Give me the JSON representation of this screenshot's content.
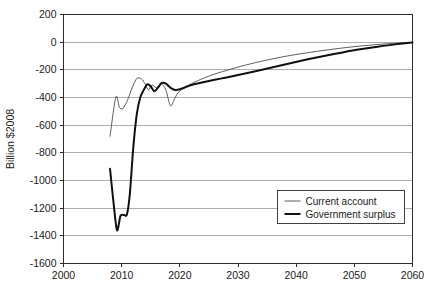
{
  "chart_data": {
    "type": "line",
    "title": "",
    "xlabel": "",
    "ylabel": "Billion $2008",
    "xlim": [
      2000,
      2060
    ],
    "ylim": [
      -1600,
      200
    ],
    "xticks": [
      2000,
      2010,
      2020,
      2030,
      2040,
      2050,
      2060
    ],
    "yticks": [
      200,
      0,
      -200,
      -400,
      -600,
      -800,
      -1000,
      -1200,
      -1400,
      -1600
    ],
    "xtick_labels": [
      "2000",
      "2010",
      "2020",
      "2030",
      "2040",
      "2050",
      "2060"
    ],
    "ytick_labels": [
      "200",
      "0",
      "-200",
      "-400",
      "-600",
      "-800",
      "-1000",
      "-1200",
      "-1400",
      "-1600"
    ],
    "grid": "horizontal",
    "legend_position": "bottom-right",
    "series": [
      {
        "name": "Current account",
        "style": "thin",
        "color": "#4a4a4a",
        "x": [
          2008,
          2009,
          2009.6,
          2010.2,
          2011,
          2011.8,
          2012.6,
          2013.4,
          2014,
          2014.6,
          2015.2,
          2016,
          2016.8,
          2017.6,
          2018.4,
          2019.2,
          2020,
          2022,
          2024,
          2026,
          2028,
          2030,
          2033,
          2036,
          2039,
          2042,
          2045,
          2048,
          2051,
          2054,
          2057,
          2060
        ],
        "y": [
          -680,
          -395,
          -470,
          -480,
          -420,
          -330,
          -262,
          -265,
          -300,
          -345,
          -310,
          -330,
          -300,
          -345,
          -460,
          -400,
          -352,
          -300,
          -262,
          -230,
          -205,
          -180,
          -148,
          -120,
          -96,
          -76,
          -58,
          -42,
          -28,
          -17,
          -8,
          -2
        ]
      },
      {
        "name": "Government surplus",
        "style": "thick",
        "color": "#111111",
        "x": [
          2008,
          2008.6,
          2009.2,
          2009.8,
          2010.4,
          2010.9,
          2011.4,
          2012,
          2012.6,
          2013.2,
          2013.8,
          2014.4,
          2015,
          2015.6,
          2016.2,
          2016.9,
          2017.6,
          2018.4,
          2019.2,
          2020,
          2022,
          2024,
          2026,
          2028,
          2030,
          2033,
          2036,
          2039,
          2042,
          2045,
          2048,
          2051,
          2054,
          2057,
          2060
        ],
        "y": [
          -915,
          -1160,
          -1360,
          -1255,
          -1250,
          -1245,
          -1100,
          -760,
          -520,
          -400,
          -345,
          -305,
          -320,
          -355,
          -330,
          -295,
          -300,
          -330,
          -345,
          -340,
          -310,
          -290,
          -272,
          -255,
          -238,
          -210,
          -182,
          -152,
          -124,
          -98,
          -74,
          -52,
          -33,
          -16,
          -3
        ]
      }
    ]
  },
  "legend": {
    "entries": [
      {
        "label": "Current account",
        "swatch": "line-thin"
      },
      {
        "label": "Government surplus",
        "swatch": "line-thick"
      }
    ]
  },
  "axes": {
    "y_title": "Billion $2008"
  }
}
